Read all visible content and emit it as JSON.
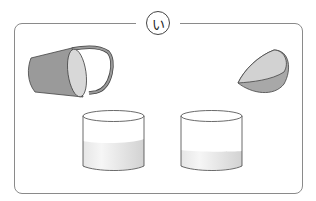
{
  "figure": {
    "label": "い",
    "items": [
      {
        "name": "cup-with-handle",
        "state": "tilted, pouring"
      },
      {
        "name": "bowl",
        "state": "tilted, pouring"
      },
      {
        "name": "left-beaker",
        "liquid_level": "high"
      },
      {
        "name": "right-beaker",
        "liquid_level": "low"
      }
    ]
  },
  "colors": {
    "outline": "#444444",
    "container_fill": "#9a9a9a",
    "container_inner": "#d6d6d6",
    "liquid": "#dcdcdc",
    "frame": "#8a8a8a"
  }
}
